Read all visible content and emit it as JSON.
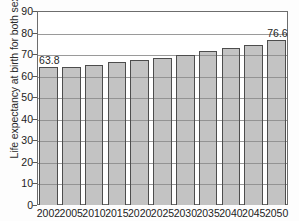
{
  "chart_data": {
    "type": "bar",
    "title": "",
    "xlabel": "",
    "ylabel": "Life expectancy at birth for both sexes",
    "categories": [
      "2002",
      "2005",
      "2010",
      "2015",
      "2020",
      "2025",
      "2030",
      "2035",
      "2040",
      "2045",
      "2050"
    ],
    "values": [
      63.8,
      64.0,
      65.0,
      66.2,
      67.3,
      68.4,
      69.8,
      71.3,
      72.9,
      74.3,
      76.6
    ],
    "ylim": [
      0,
      90
    ],
    "yticks": [
      0,
      10,
      20,
      30,
      40,
      50,
      60,
      70,
      80,
      90
    ],
    "ytick_labels": [
      "0",
      "10",
      "20",
      "30",
      "40",
      "50",
      "60",
      "70",
      "80",
      "90"
    ],
    "grid": true,
    "legend": "none",
    "bar_color": "#c3c3c3",
    "bar_edge_color": "#4d4d4d",
    "annotations": [
      {
        "label": "63.8",
        "category": "2002",
        "value": 63.8
      },
      {
        "label": "76.6",
        "category": "2050",
        "value": 76.6
      }
    ]
  }
}
